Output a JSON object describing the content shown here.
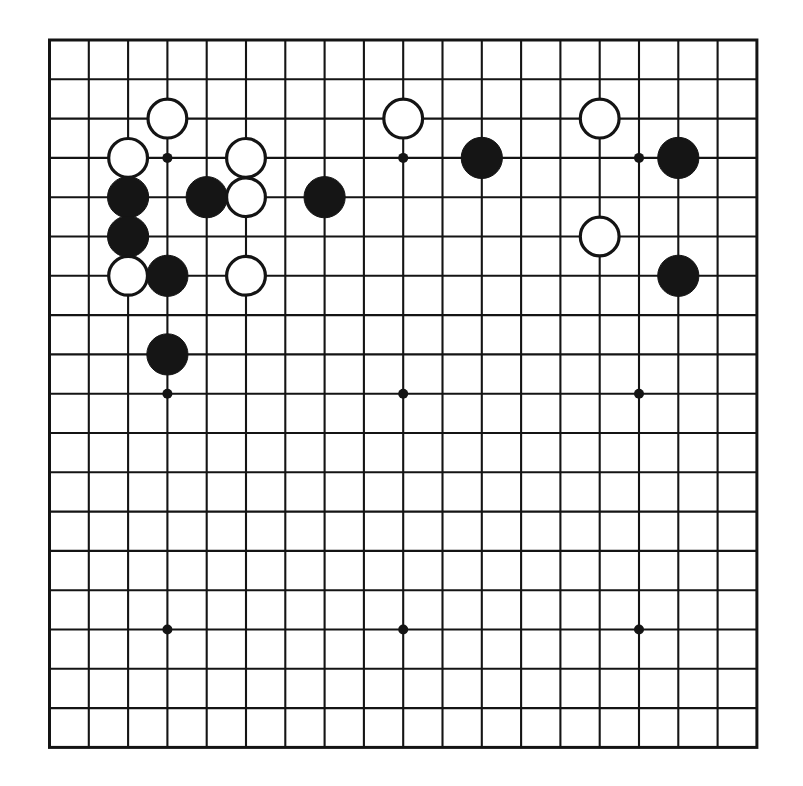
{
  "board": {
    "title": "Go board diagram",
    "size": 19,
    "geometry": {
      "origin_x": 49.5,
      "origin_y": 40.0,
      "spacing": 39.3,
      "stone_radius": 20.6,
      "hoshi_radius": 5.0,
      "line_width": 2.1,
      "edge_width": 3.0
    },
    "colors": {
      "background": "#ffffff",
      "line": "#141414",
      "black_stone": "#151515",
      "white_stone_fill": "#ffffff",
      "white_stone_edge": "#141414"
    },
    "star_points": [
      {
        "col": 3,
        "row": 3
      },
      {
        "col": 9,
        "row": 3
      },
      {
        "col": 15,
        "row": 3
      },
      {
        "col": 3,
        "row": 9
      },
      {
        "col": 9,
        "row": 9
      },
      {
        "col": 15,
        "row": 9
      },
      {
        "col": 3,
        "row": 15
      },
      {
        "col": 9,
        "row": 15
      },
      {
        "col": 15,
        "row": 15
      }
    ],
    "stones": [
      {
        "color": "white",
        "col": 3,
        "row": 2
      },
      {
        "color": "white",
        "col": 9,
        "row": 2
      },
      {
        "color": "white",
        "col": 14,
        "row": 2
      },
      {
        "color": "white",
        "col": 2,
        "row": 3
      },
      {
        "color": "white",
        "col": 5,
        "row": 3
      },
      {
        "color": "black",
        "col": 11,
        "row": 3
      },
      {
        "color": "black",
        "col": 16,
        "row": 3
      },
      {
        "color": "black",
        "col": 2,
        "row": 4
      },
      {
        "color": "black",
        "col": 4,
        "row": 4
      },
      {
        "color": "white",
        "col": 5,
        "row": 4
      },
      {
        "color": "black",
        "col": 7,
        "row": 4
      },
      {
        "color": "black",
        "col": 2,
        "row": 5
      },
      {
        "color": "white",
        "col": 14,
        "row": 5
      },
      {
        "color": "white",
        "col": 2,
        "row": 6
      },
      {
        "color": "black",
        "col": 3,
        "row": 6
      },
      {
        "color": "white",
        "col": 5,
        "row": 6
      },
      {
        "color": "black",
        "col": 16,
        "row": 6
      },
      {
        "color": "black",
        "col": 3,
        "row": 8
      }
    ]
  }
}
